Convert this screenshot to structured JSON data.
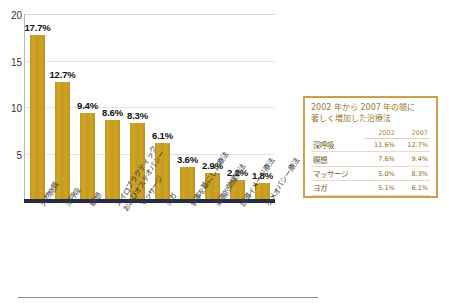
{
  "chart_data": {
    "type": "bar",
    "title": "",
    "xlabel": "",
    "ylabel": "",
    "ylim": [
      0,
      20
    ],
    "yticks": [
      5,
      10,
      15,
      20
    ],
    "grid": true,
    "legend_position": "none",
    "bar_color": "#c49a20",
    "baseline_color": "#262b4a",
    "categories": [
      "天然物質",
      "深呼吸",
      "瞑想",
      "カイロプラクティック\nおよびオステオパシー",
      "マッサージ",
      "ヨガ",
      "食事を基にした療法",
      "漸進的弛緩療法",
      "誘導イメージ療法",
      "ホメオパシー療法"
    ],
    "values": [
      17.7,
      12.7,
      9.4,
      8.6,
      8.3,
      6.1,
      3.6,
      2.9,
      2.2,
      1.8
    ],
    "value_labels": [
      "17.7%",
      "12.7%",
      "9.4%",
      "8.6%",
      "8.3%",
      "6.1%",
      "3.6%",
      "2.9%",
      "2.2%",
      "1.8%"
    ]
  },
  "inset": {
    "title_line1": "2002 年から 2007 年の間に",
    "title_line2": "著しく増加した治療法",
    "border_color": "#c9a24a",
    "columns": [
      "",
      "2002",
      "2007"
    ],
    "rows": [
      {
        "label": "深呼吸",
        "y2002": "11.6%",
        "y2007": "12.7%"
      },
      {
        "label": "瞑想",
        "y2002": "7.6%",
        "y2007": "9.4%"
      },
      {
        "label": "マッサージ",
        "y2002": "5.0%",
        "y2007": "8.3%"
      },
      {
        "label": "ヨガ",
        "y2002": "5.1%",
        "y2007": "6.1%"
      }
    ]
  },
  "axis": {
    "tick_20": "20",
    "tick_15": "15",
    "tick_10": "10",
    "tick_5": "5"
  }
}
